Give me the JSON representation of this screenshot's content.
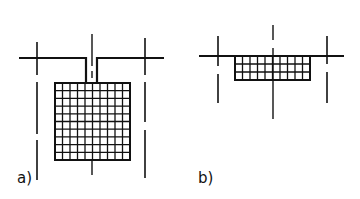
{
  "figure": {
    "panels": [
      {
        "id": "a",
        "label": "a)",
        "grid_cols": 10,
        "grid_rows": 10
      },
      {
        "id": "b",
        "label": "b)",
        "grid_cols": 10,
        "grid_rows": 3
      }
    ],
    "colors": {
      "ink": "#111111",
      "background": "#ffffff"
    }
  }
}
